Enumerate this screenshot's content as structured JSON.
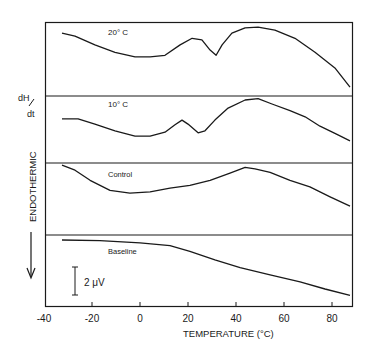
{
  "chart_data": {
    "type": "line",
    "title": "",
    "xlabel": "TEMPERATURE (°C)",
    "ylabel": "dH/dt  ENDOTHERMIC",
    "xlim": [
      -40,
      88
    ],
    "xticks": [
      -40,
      -20,
      0,
      20,
      40,
      60,
      80
    ],
    "xtick_labels": [
      "-40",
      "-20",
      "0",
      "20",
      "40",
      "60",
      "80"
    ],
    "grid": false,
    "legend": "none (panels labeled inline)",
    "scale_bar": "2 μV",
    "endothermic_direction": "down",
    "panels": [
      {
        "name": "20° C",
        "series": [
          [
            -32.5,
            0.15
          ],
          [
            -27.1,
            0.19
          ],
          [
            -18.8,
            0.31
          ],
          [
            -10.4,
            0.41
          ],
          [
            -2.1,
            0.47
          ],
          [
            4.2,
            0.47
          ],
          [
            10.4,
            0.45
          ],
          [
            16.7,
            0.31
          ],
          [
            21.7,
            0.22
          ],
          [
            25.8,
            0.24
          ],
          [
            29.2,
            0.38
          ],
          [
            31.7,
            0.45
          ],
          [
            34.2,
            0.31
          ],
          [
            38.3,
            0.15
          ],
          [
            43.8,
            0.08
          ],
          [
            49.2,
            0.07
          ],
          [
            56.2,
            0.11
          ],
          [
            64.6,
            0.22
          ],
          [
            72.9,
            0.41
          ],
          [
            81.2,
            0.62
          ],
          [
            87.5,
            0.88
          ]
        ]
      },
      {
        "name": "10° C",
        "series": [
          [
            -32.5,
            0.34
          ],
          [
            -25.8,
            0.34
          ],
          [
            -18.8,
            0.42
          ],
          [
            -10.4,
            0.52
          ],
          [
            -2.1,
            0.6
          ],
          [
            4.2,
            0.6
          ],
          [
            10.4,
            0.54
          ],
          [
            14.6,
            0.43
          ],
          [
            17.5,
            0.36
          ],
          [
            20.0,
            0.42
          ],
          [
            24.2,
            0.55
          ],
          [
            27.1,
            0.52
          ],
          [
            31.2,
            0.36
          ],
          [
            36.7,
            0.18
          ],
          [
            43.8,
            0.06
          ],
          [
            49.2,
            0.04
          ],
          [
            55.0,
            0.12
          ],
          [
            62.5,
            0.22
          ],
          [
            68.8,
            0.31
          ],
          [
            75.0,
            0.45
          ],
          [
            82.5,
            0.58
          ],
          [
            87.5,
            0.67
          ]
        ]
      },
      {
        "name": "Control",
        "series": [
          [
            -32.5,
            0.03
          ],
          [
            -27.1,
            0.1
          ],
          [
            -20.8,
            0.24
          ],
          [
            -12.5,
            0.38
          ],
          [
            -4.2,
            0.42
          ],
          [
            4.2,
            0.4
          ],
          [
            12.5,
            0.35
          ],
          [
            20.8,
            0.31
          ],
          [
            29.2,
            0.24
          ],
          [
            37.5,
            0.14
          ],
          [
            43.8,
            0.06
          ],
          [
            47.9,
            0.08
          ],
          [
            54.2,
            0.13
          ],
          [
            62.5,
            0.24
          ],
          [
            70.8,
            0.33
          ],
          [
            79.2,
            0.47
          ],
          [
            87.5,
            0.6
          ]
        ]
      },
      {
        "name": "Baseline",
        "series": [
          [
            -32.5,
            0.07
          ],
          [
            -16.7,
            0.08
          ],
          [
            0.0,
            0.11
          ],
          [
            12.5,
            0.15
          ],
          [
            20.8,
            0.23
          ],
          [
            31.2,
            0.35
          ],
          [
            41.7,
            0.46
          ],
          [
            54.2,
            0.56
          ],
          [
            66.7,
            0.66
          ],
          [
            77.1,
            0.76
          ],
          [
            87.5,
            0.85
          ]
        ]
      }
    ]
  },
  "labels": {
    "panel_20": "20° C",
    "panel_10": "10° C",
    "panel_control": "Control",
    "panel_baseline": "Baseline",
    "ylabel_top": "dH",
    "ylabel_bottom": "dt",
    "ylabel_endo": "ENDOTHERMIC",
    "scale": "2 μV",
    "xlabel": "TEMPERATURE (°C)"
  },
  "colors": {
    "ink": "#1a1a1a",
    "background": "#ffffff"
  }
}
